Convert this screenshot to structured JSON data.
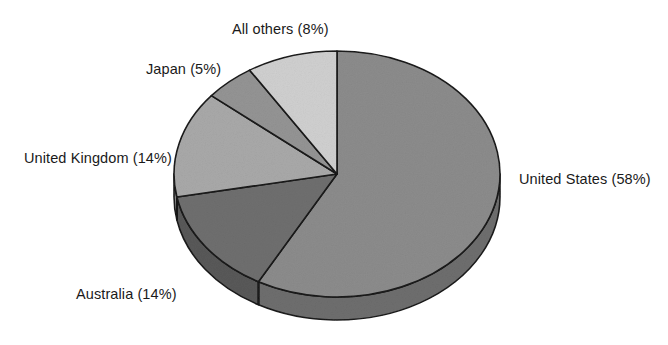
{
  "chart_data": {
    "type": "pie",
    "title": "",
    "subtitle": "",
    "xlabel": "",
    "ylabel": "",
    "legend_position": "none",
    "labels_position": "outside",
    "grid": false,
    "three_d": true,
    "start_angle_deg": 0,
    "direction": "clockwise",
    "categories": [
      "United States",
      "Australia",
      "United Kingdom",
      "Japan",
      "All others"
    ],
    "values": [
      58,
      14,
      14,
      5,
      8
    ],
    "unit": "%",
    "slices": [
      {
        "name": "United States",
        "value": 58,
        "label": "United States (58%)",
        "color": "#8c8c8c",
        "side_color": "#6e6e6e",
        "start_deg": 0,
        "end_deg": 208.8
      },
      {
        "name": "Australia",
        "value": 14,
        "label": "Australia (14%)",
        "color": "#6f6f6f",
        "side_color": "#595959",
        "start_deg": 208.8,
        "end_deg": 259.2
      },
      {
        "name": "United Kingdom",
        "value": 14,
        "label": "United Kingdom (14%)",
        "color": "#a9a9a9",
        "side_color": "#8a8a8a",
        "start_deg": 259.2,
        "end_deg": 309.6
      },
      {
        "name": "Japan",
        "value": 5,
        "label": "Japan (5%)",
        "color": "#949494",
        "side_color": "#777777",
        "start_deg": 309.6,
        "end_deg": 327.6
      },
      {
        "name": "All others",
        "value": 8,
        "label": "All others (8%)",
        "color": "#d0d0d0",
        "side_color": "#ababab",
        "start_deg": 327.6,
        "end_deg": 360
      }
    ],
    "labels": {
      "all_others": "All others (8%)",
      "japan": "Japan (5%)",
      "united_kingdom": "United Kingdom (14%)",
      "australia": "Australia (14%)",
      "united_states": "United States (58%)"
    },
    "geometry": {
      "center_x": 337,
      "center_y": 174,
      "radius_x": 163,
      "radius_y": 123,
      "depth": 23
    },
    "colors": {
      "background": "#ffffff",
      "outline": "#1a1a1a",
      "text": "#1a1a1a"
    }
  }
}
